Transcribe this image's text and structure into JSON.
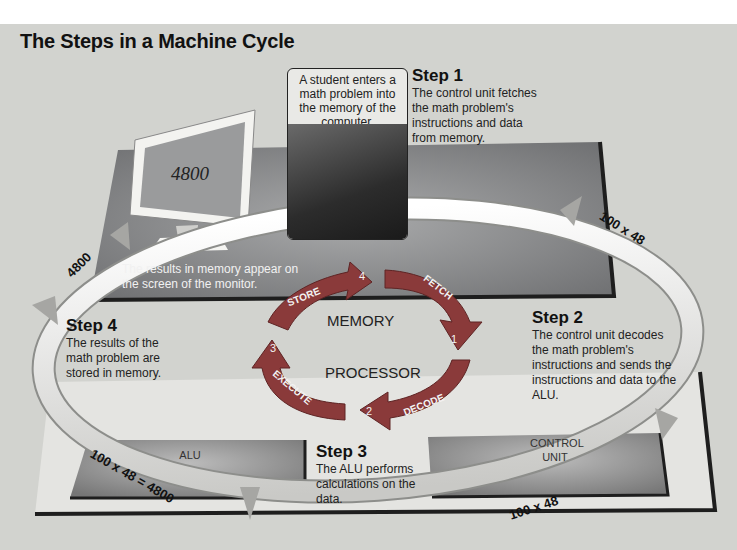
{
  "title": "The Steps in a Machine Cycle",
  "intro_caption": "A student enters a math problem into the memory of the computer.",
  "monitor": {
    "screen_value": "4800",
    "caption": "The results in memory appear on the screen of the monitor."
  },
  "steps": [
    {
      "heading": "Step 1",
      "text": "The control unit fetches the math problem's instructions and data from memory."
    },
    {
      "heading": "Step 2",
      "text": "The control unit decodes the math problem's instructions and sends the instructions and data to the ALU."
    },
    {
      "heading": "Step 3",
      "text": "The ALU performs calculations on the data."
    },
    {
      "heading": "Step 4",
      "text": "The results of the math problem are stored in memory."
    }
  ],
  "cycle": {
    "center_top": "MEMORY",
    "center_bottom": "PROCESSOR",
    "arrows": [
      {
        "label": "FETCH",
        "number": "1"
      },
      {
        "label": "DECODE",
        "number": "2"
      },
      {
        "label": "EXECUTE",
        "number": "3"
      },
      {
        "label": "STORE",
        "number": "4"
      }
    ]
  },
  "components": {
    "alu": "ALU",
    "control_unit": "CONTROL UNIT"
  },
  "pipe_labels": {
    "top_right": "100 x 48",
    "bottom_right": "100 x 48",
    "bottom_left": "100 x 48 = 4800",
    "top_left": "4800"
  },
  "colors": {
    "background": "#d2d3cf",
    "platform": "#7d7e80",
    "cycle_arrow": "#8a3a3a",
    "pipe": "#eeeeea"
  }
}
